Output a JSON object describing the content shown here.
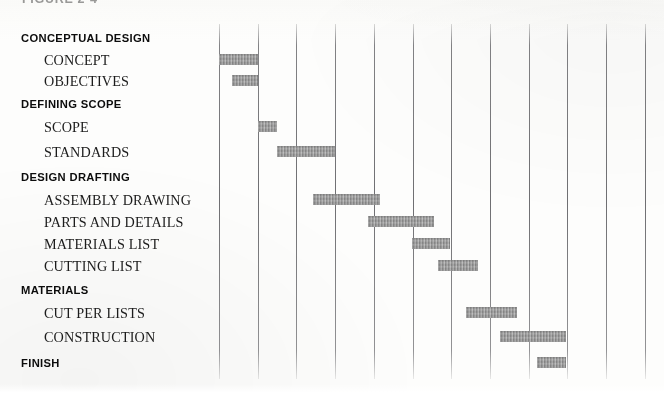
{
  "figure": {
    "caption": "FIGURE 2-4"
  },
  "chart_data": {
    "type": "bar",
    "subtype": "gantt",
    "title": "FIGURE 2-4",
    "xlabel": "",
    "ylabel": "",
    "grid": true,
    "legend": false,
    "x_axis": {
      "gridline_count": 12,
      "first_gridline_px": 219,
      "gridline_spacing_px": 38.7,
      "units": "time periods"
    },
    "bar_color": "#9b9b9b",
    "gridline_color": "#3c3c3c",
    "categories": [
      "CONCEPTUAL DESIGN",
      "CONCEPT",
      "OBJECTIVES",
      "DEFINING SCOPE",
      "SCOPE",
      "STANDARDS",
      "DESIGN DRAFTING",
      "ASSEMBLY DRAWING",
      "PARTS AND DETAILS",
      "MATERIALS LIST",
      "CUTTING LIST",
      "MATERIALS",
      "CUT PER LISTS",
      "CONSTRUCTION",
      "FINISH"
    ],
    "tasks": [
      {
        "label": "CONCEPTUAL DESIGN",
        "level": "phase",
        "y": 38,
        "start": null,
        "end": null
      },
      {
        "label": "CONCEPT",
        "level": "item",
        "y": 60,
        "start": 0.0,
        "end": 1.0
      },
      {
        "label": "OBJECTIVES",
        "level": "item",
        "y": 81,
        "start": 0.34,
        "end": 1.0
      },
      {
        "label": "DEFINING SCOPE",
        "level": "phase",
        "y": 104,
        "start": null,
        "end": null
      },
      {
        "label": "SCOPE",
        "level": "item",
        "y": 127,
        "start": 1.0,
        "end": 1.49
      },
      {
        "label": "STANDARDS",
        "level": "item",
        "y": 152,
        "start": 1.49,
        "end": 3.0
      },
      {
        "label": "DESIGN DRAFTING",
        "level": "phase",
        "y": 177,
        "start": null,
        "end": null
      },
      {
        "label": "ASSEMBLY DRAWING",
        "level": "item",
        "y": 200,
        "start": 2.43,
        "end": 4.16
      },
      {
        "label": "PARTS AND DETAILS",
        "level": "item",
        "y": 222,
        "start": 3.85,
        "end": 5.56
      },
      {
        "label": "MATERIALS LIST",
        "level": "item",
        "y": 244,
        "start": 4.99,
        "end": 5.97
      },
      {
        "label": "CUTTING LIST",
        "level": "item",
        "y": 266,
        "start": 5.66,
        "end": 6.69
      },
      {
        "label": "MATERIALS",
        "level": "phase",
        "y": 290,
        "start": null,
        "end": null
      },
      {
        "label": "CUT PER LISTS",
        "level": "item",
        "y": 313,
        "start": 6.38,
        "end": 7.7
      },
      {
        "label": "CONSTRUCTION",
        "level": "item",
        "y": 337,
        "start": 7.26,
        "end": 8.96
      },
      {
        "label": "FINISH",
        "level": "phase",
        "y": 363,
        "start": 8.22,
        "end": 8.96
      }
    ]
  }
}
